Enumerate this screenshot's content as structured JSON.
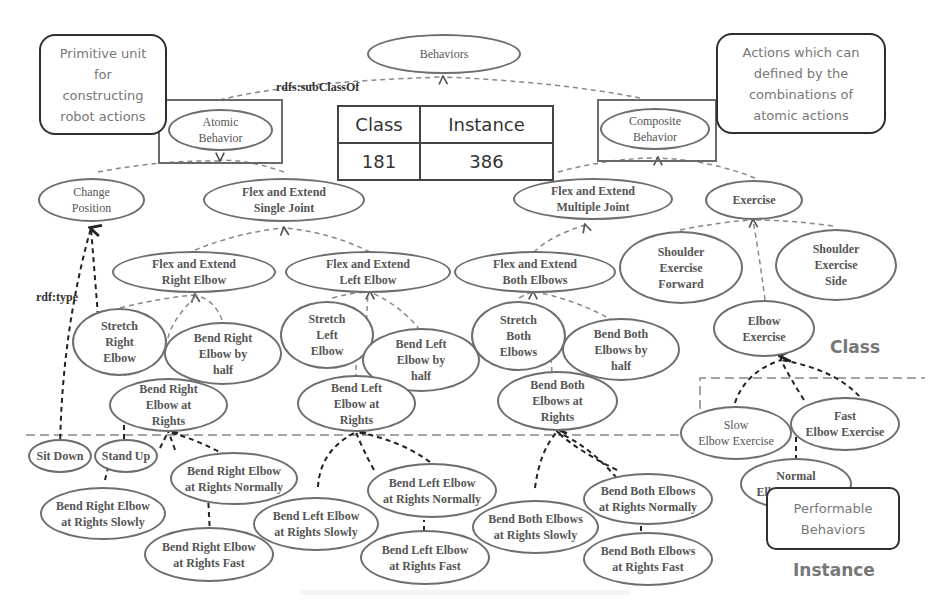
{
  "diagram": {
    "root": "Behaviors",
    "relation_labels": {
      "subclass": "rdfs:subClassOf",
      "type": "rdf:type"
    },
    "callouts": {
      "atomic": "Primitive unit\nfor\nconstructing\nrobot actions",
      "composite": "Actions which can\ndefined by the\ncombinations of\natomic actions",
      "performable": "Performable\nBehaviors"
    },
    "stats_table": {
      "headers": [
        "Class",
        "Instance"
      ],
      "values": [
        "181",
        "386"
      ]
    },
    "region_labels": {
      "class": "Class",
      "instance": "Instance"
    },
    "classes": {
      "atomic_behavior": "Atomic\nBehavior",
      "composite_behavior": "Composite\nBehavior",
      "change_position": "Change\nPosition",
      "flex_extend_single": "Flex and Extend\nSingle Joint",
      "flex_extend_multiple": "Flex and Extend\nMultiple Joint",
      "exercise": "Exercise",
      "flex_extend_right_elbow": "Flex and Extend\nRight Elbow",
      "flex_extend_left_elbow": "Flex and Extend\nLeft Elbow",
      "flex_extend_both_elbows": "Flex and Extend\nBoth Elbows",
      "shoulder_exercise_forward": "Shoulder\nExercise\nForward",
      "shoulder_exercise_side": "Shoulder\nExercise\nSide",
      "stretch_right_elbow": "Stretch\nRight\nElbow",
      "bend_right_elbow_half": "Bend Right\nElbow by\nhalf",
      "stretch_left_elbow": "Stretch\nLeft\nElbow",
      "bend_left_elbow_half": "Bend Left\nElbow by\nhalf",
      "stretch_both_elbows": "Stretch\nBoth\nElbows",
      "bend_both_elbows_half": "Bend Both\nElbows by\nhalf",
      "elbow_exercise": "Elbow\nExercise",
      "bend_right_elbow_rights": "Bend Right\nElbow at\nRights",
      "bend_left_elbow_rights": "Bend Left\nElbow at\nRights",
      "bend_both_elbows_rights": "Bend Both\nElbows at\nRights"
    },
    "instances": {
      "sit_down": "Sit Down",
      "stand_up": "Stand Up",
      "bend_right_slowly": "Bend Right Elbow\nat Rights Slowly",
      "bend_right_normally": "Bend Right Elbow\nat Rights Normally",
      "bend_right_fast": "Bend Right Elbow\nat Rights Fast",
      "bend_left_slowly": "Bend Left Elbow\nat Rights Slowly",
      "bend_left_normally": "Bend Left Elbow\nat Rights Normally",
      "bend_left_fast": "Bend Left Elbow\nat Rights Fast",
      "bend_both_slowly": "Bend Both Elbows\nat Rights Slowly",
      "bend_both_normally": "Bend Both Elbows\nat Rights Normally",
      "bend_both_fast": "Bend Both Elbows\nat Rights Fast",
      "slow_elbow_exercise": "Slow\nElbow Exercise",
      "fast_elbow_exercise": "Fast\nElbow Exercise",
      "normal_elbow_exercise": "Normal\nElbow Exercise"
    }
  }
}
